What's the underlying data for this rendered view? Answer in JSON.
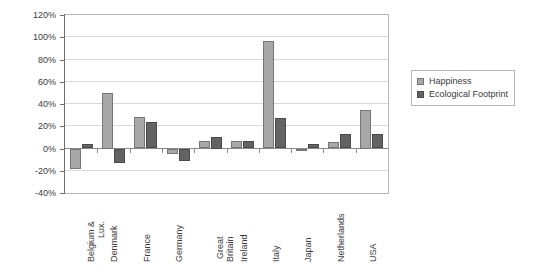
{
  "chart_data": {
    "type": "bar",
    "title": "",
    "subtitle": "",
    "xlabel": "",
    "ylabel": "",
    "ylim": [
      -40,
      120
    ],
    "ytick_step": 20,
    "ytick_labels": [
      "120%",
      "100%",
      "80%",
      "60%",
      "40%",
      "20%",
      "0%",
      "-20%",
      "-40%"
    ],
    "ytick_values": [
      120,
      100,
      80,
      60,
      40,
      20,
      0,
      -20,
      -40
    ],
    "grid": true,
    "legend_position": "right",
    "categories": [
      "Belgium & Lux.",
      "Denmark",
      "France",
      "Germany",
      "Great Britain",
      "Ireland",
      "Italy",
      "Japan",
      "Netherlands",
      "USA"
    ],
    "category_lines": [
      [
        "Belgium &",
        "Lux."
      ],
      [
        "Denmark"
      ],
      [
        "France"
      ],
      [
        "Germany"
      ],
      [
        "Great",
        "Britain"
      ],
      [
        "Ireland"
      ],
      [
        "Italy"
      ],
      [
        "Japan"
      ],
      [
        "Netherlands"
      ],
      [
        "USA"
      ]
    ],
    "series": [
      {
        "name": "Happiness",
        "color": "#a8a8a8",
        "values": [
          -18,
          50,
          28,
          -5,
          7,
          7,
          97,
          -1,
          6,
          35
        ]
      },
      {
        "name": "Ecological Footprint",
        "color": "#636363",
        "values": [
          4,
          -13,
          24,
          -11,
          10,
          7,
          27,
          4,
          13,
          13
        ]
      }
    ]
  },
  "legend": {
    "items": [
      {
        "label": "Happiness",
        "color": "#a8a8a8"
      },
      {
        "label": "Ecological Footprint",
        "color": "#636363"
      }
    ]
  },
  "colors": {
    "happiness": "#a8a8a8",
    "ecological_footprint": "#636363",
    "gridline": "#d9d9d9",
    "axis": "#6e6e6e",
    "frame": "#b5b5b5",
    "background": "#ffffff"
  }
}
